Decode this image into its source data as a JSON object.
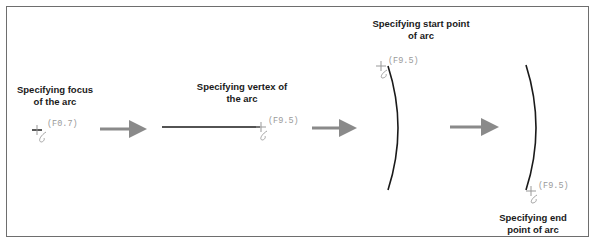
{
  "diagram": {
    "steps": [
      {
        "label_line1": "Specifying focus",
        "label_line2": "of the arc",
        "coord": "(F0.7)"
      },
      {
        "label_line1": "Specifying vertex of",
        "label_line2": "the arc",
        "coord": "(F9.5)"
      },
      {
        "label_line1": "Specifying start point",
        "label_line2": "of arc",
        "coord": "(F9.5)"
      },
      {
        "label_line1": "Specifying end",
        "label_line2": "point of arc",
        "coord": "(F9.5)"
      }
    ],
    "colors": {
      "frame": "#6e6e6e",
      "arrow": "#8a8a8a",
      "line": "#1a1a1a",
      "coord_text": "#9a9a9a",
      "cursor": "#8a8a8a"
    }
  }
}
